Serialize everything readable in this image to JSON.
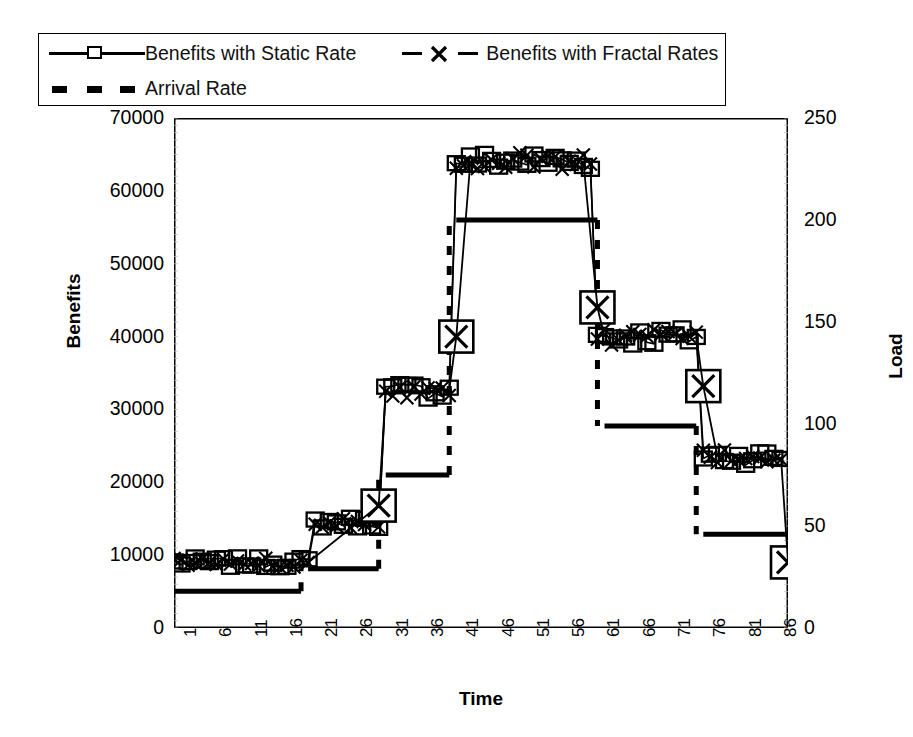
{
  "legend": {
    "entries": [
      {
        "label": "Benefits with Static Rate",
        "key": "solid-line-open-square-marker",
        "color": "#000000"
      },
      {
        "label": "Benefits with Fractal Rates",
        "key": "dashed-line-x-marker",
        "color": "#000000"
      },
      {
        "label": "Arrival Rate",
        "key": "thick-dashed-line",
        "color": "#000000"
      }
    ]
  },
  "chart_data": {
    "type": "line",
    "title": "",
    "xlabel": "Time",
    "ylabel": "Benefits",
    "y2label": "Load",
    "ylim": [
      0,
      70000
    ],
    "y2lim": [
      0,
      250
    ],
    "xlim": [
      1,
      88
    ],
    "grid": false,
    "legend_position": "top",
    "y_ticks": [
      0,
      10000,
      20000,
      30000,
      40000,
      50000,
      60000,
      70000
    ],
    "y2_ticks": [
      0,
      50,
      100,
      150,
      200,
      250
    ],
    "x_ticks": [
      1,
      6,
      11,
      16,
      21,
      26,
      31,
      36,
      41,
      46,
      51,
      56,
      61,
      66,
      71,
      76,
      81,
      86
    ],
    "series": [
      {
        "name": "Benefits with Static Rate",
        "axis": "left",
        "marker": "open-square",
        "linestyle": "solid",
        "x": [
          1,
          2,
          3,
          4,
          5,
          6,
          7,
          8,
          9,
          10,
          11,
          12,
          13,
          14,
          15,
          16,
          17,
          18,
          19,
          20,
          21,
          22,
          23,
          24,
          25,
          26,
          27,
          28,
          29,
          30,
          31,
          32,
          33,
          34,
          35,
          36,
          37,
          38,
          39,
          40,
          41,
          42,
          43,
          44,
          45,
          46,
          47,
          48,
          49,
          50,
          51,
          52,
          53,
          54,
          55,
          56,
          57,
          58,
          59,
          60,
          61,
          62,
          63,
          64,
          65,
          66,
          67,
          68,
          69,
          70,
          71,
          72,
          73,
          74,
          75,
          76,
          77,
          78,
          79,
          80,
          81,
          82,
          83,
          84,
          85,
          86,
          87,
          88
        ],
        "values": [
          9000,
          8800,
          9200,
          9100,
          8700,
          9300,
          8900,
          9000,
          9200,
          8800,
          9100,
          8900,
          9300,
          9000,
          8700,
          9200,
          8800,
          9100,
          9000,
          8900,
          14500,
          14200,
          14800,
          14600,
          14300,
          14900,
          14500,
          14200,
          14700,
          14400,
          32500,
          32000,
          33000,
          32800,
          32200,
          33200,
          32600,
          32100,
          32900,
          32400,
          64000,
          63600,
          64500,
          64200,
          63800,
          64600,
          64000,
          63500,
          64400,
          64100,
          63700,
          64500,
          64000,
          63600,
          64300,
          64000,
          63800,
          64400,
          64100,
          63900,
          40000,
          39600,
          40400,
          40100,
          39700,
          40500,
          40000,
          39500,
          40300,
          40000,
          39800,
          40400,
          40100,
          39700,
          40200,
          23500,
          23200,
          23900,
          23600,
          23300,
          24000,
          23500,
          23200,
          23800,
          23500,
          23300,
          9000,
          9000
        ],
        "clusters": [
          {
            "x_start": 1,
            "x_end": 20,
            "level": 9000,
            "spread": 700
          },
          {
            "x_start": 21,
            "x_end": 30,
            "level": 14500,
            "spread": 800
          },
          {
            "x_start": 31,
            "x_end": 40,
            "level": 32600,
            "spread": 1200
          },
          {
            "x_start": 41,
            "x_end": 60,
            "level": 64100,
            "spread": 1300
          },
          {
            "x_start": 61,
            "x_end": 75,
            "level": 40000,
            "spread": 1300
          },
          {
            "x_start": 76,
            "x_end": 87,
            "level": 23500,
            "spread": 1100
          }
        ]
      },
      {
        "name": "Benefits with Fractal Rates",
        "axis": "left",
        "marker": "x-cross",
        "linestyle": "dashed",
        "x": [
          1,
          20,
          30,
          31,
          40,
          41,
          60,
          61,
          75,
          76,
          87,
          88
        ],
        "values": [
          9000,
          9000,
          16800,
          32600,
          32600,
          40000,
          64100,
          44000,
          40000,
          33200,
          23500,
          9000
        ],
        "highlight_points": [
          {
            "x": 30,
            "value": 16800
          },
          {
            "x": 41,
            "value": 40000
          },
          {
            "x": 61,
            "value": 44000
          },
          {
            "x": 76,
            "value": 33200
          },
          {
            "x": 88,
            "value": 9000
          }
        ]
      },
      {
        "name": "Arrival Rate",
        "axis": "right",
        "marker": "none",
        "linestyle": "thick-dashed",
        "steps": [
          {
            "x_start": 1,
            "x_end": 19,
            "load": 18
          },
          {
            "x_start": 20,
            "x_end": 30,
            "load": 29
          },
          {
            "x_start": 31,
            "x_end": 40,
            "load": 75
          },
          {
            "x_start": 41,
            "x_end": 61,
            "load": 200
          },
          {
            "x_start": 62,
            "x_end": 75,
            "load": 99
          },
          {
            "x_start": 76,
            "x_end": 88,
            "load": 46
          }
        ]
      }
    ]
  }
}
